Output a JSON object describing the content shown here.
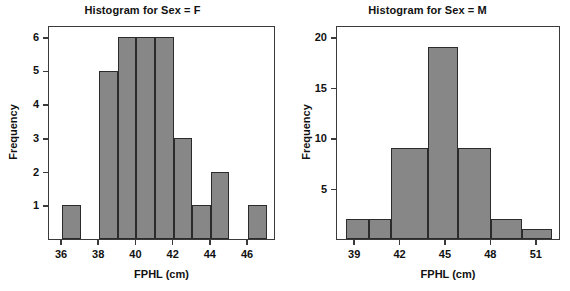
{
  "figure": {
    "width": 570,
    "height": 291,
    "background": "#ffffff",
    "bar_fill": "#878787",
    "bar_edge": "#2b2b2b",
    "axis_color": "#3a3a3a",
    "text_color": "#111111"
  },
  "chart_data": [
    {
      "type": "bar",
      "title": "Histogram for Sex = F",
      "xlabel": "FPHL (cm)",
      "ylabel": "Frequency",
      "xlim": [
        35.3,
        47.5
      ],
      "ylim": [
        0,
        6.35
      ],
      "grid": false,
      "legend": null,
      "xticks": [
        36,
        38,
        40,
        42,
        44,
        46
      ],
      "xtick_labels": [
        "36",
        "38",
        "40",
        "42",
        "44",
        "46"
      ],
      "yticks": [
        1,
        2,
        3,
        4,
        5,
        6
      ],
      "ytick_labels": [
        "1",
        "2",
        "3",
        "4",
        "5",
        "6"
      ],
      "bin_width": 1,
      "bins": [
        {
          "left": 36,
          "right": 37,
          "value": 1
        },
        {
          "left": 38,
          "right": 39,
          "value": 5
        },
        {
          "left": 39,
          "right": 40,
          "value": 6
        },
        {
          "left": 40,
          "right": 41,
          "value": 6
        },
        {
          "left": 41,
          "right": 42,
          "value": 6
        },
        {
          "left": 42,
          "right": 43,
          "value": 3
        },
        {
          "left": 43,
          "right": 44,
          "value": 1
        },
        {
          "left": 44,
          "right": 45,
          "value": 2
        },
        {
          "left": 46,
          "right": 47,
          "value": 1
        }
      ],
      "categories": [
        "36-37",
        "38-39",
        "39-40",
        "40-41",
        "41-42",
        "42-43",
        "43-44",
        "44-45",
        "46-47"
      ],
      "values": [
        1,
        5,
        6,
        6,
        6,
        3,
        1,
        2,
        1
      ]
    },
    {
      "type": "bar",
      "title": "Histogram for Sex = M",
      "xlabel": "FPHL (cm)",
      "ylabel": "Frequency",
      "xlim": [
        37.8,
        52.6
      ],
      "ylim": [
        0,
        21.2
      ],
      "grid": false,
      "legend": null,
      "xticks": [
        39,
        42,
        45,
        48,
        51
      ],
      "xtick_labels": [
        "39",
        "42",
        "45",
        "48",
        "51"
      ],
      "yticks": [
        5,
        10,
        15,
        20
      ],
      "ytick_labels": [
        "5",
        "10",
        "15",
        "20"
      ],
      "bin_width": 1.5,
      "bins": [
        {
          "left": 38.4,
          "right": 39.9,
          "value": 2
        },
        {
          "left": 39.9,
          "right": 41.4,
          "value": 2
        },
        {
          "left": 41.4,
          "right": 43.8,
          "value": 9
        },
        {
          "left": 43.8,
          "right": 45.8,
          "value": 19
        },
        {
          "left": 45.8,
          "right": 48.0,
          "value": 9
        },
        {
          "left": 48.0,
          "right": 50.0,
          "value": 2
        },
        {
          "left": 50.0,
          "right": 52.0,
          "value": 1
        }
      ],
      "categories": [
        "38.4-39.9",
        "39.9-41.4",
        "41.4-43.8",
        "43.8-45.8",
        "45.8-48.0",
        "48.0-50.0",
        "50.0-52.0"
      ],
      "values": [
        2,
        2,
        9,
        19,
        9,
        2,
        1
      ]
    }
  ]
}
